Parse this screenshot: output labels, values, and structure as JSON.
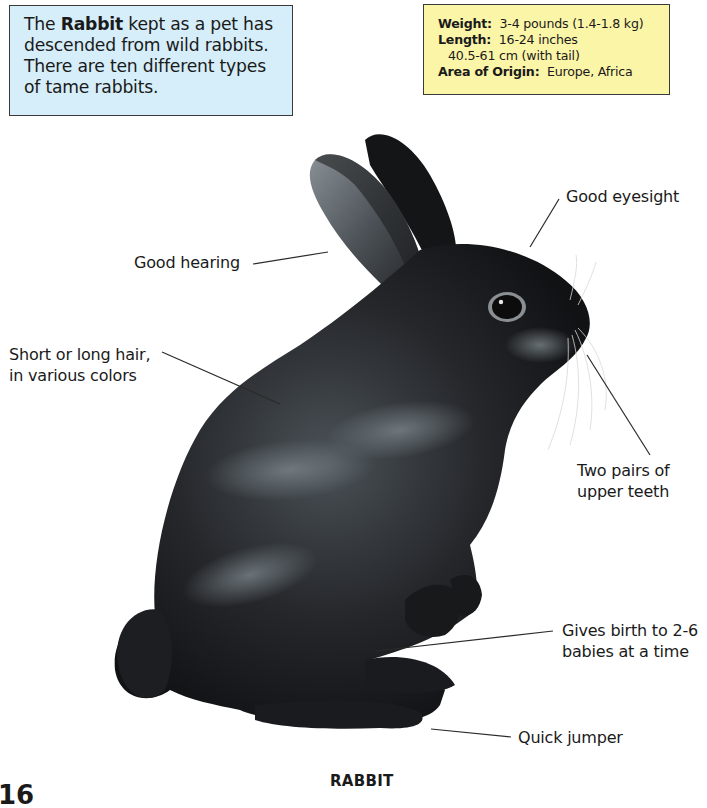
{
  "intro": {
    "prefix": "The ",
    "bold": "Rabbit",
    "suffix": " kept as a pet has descended from wild rabbits. There are ten different types of tame rabbits."
  },
  "facts": {
    "weight_label": "Weight:",
    "weight_value": "3-4 pounds (1.4-1.8 kg)",
    "length_label": "Length:",
    "length_value": "16-24 inches",
    "length_metric": "40.5-61 cm (with tail)",
    "origin_label": "Area of Origin:",
    "origin_value": "Europe, Africa"
  },
  "callouts": {
    "hearing": "Good hearing",
    "hair_line1": "Short or long hair,",
    "hair_line2": "in various colors",
    "eyesight": "Good eyesight",
    "teeth_line1": "Two pairs of",
    "teeth_line2": "upper teeth",
    "birth_line1": "Gives birth to 2-6",
    "birth_line2": "babies at a time",
    "jumper": "Quick jumper"
  },
  "caption": "RABBIT",
  "page_number": "16",
  "colors": {
    "intro_bg": "#d6eef9",
    "facts_bg": "#fbf5a8",
    "rabbit_fur": "#1c1d20",
    "rabbit_highlight": "#6c747a"
  }
}
